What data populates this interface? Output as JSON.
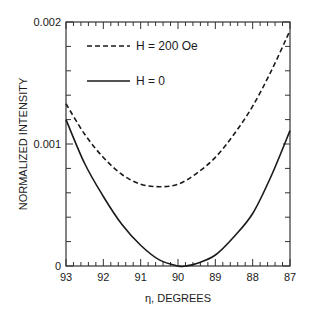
{
  "chart_data": {
    "type": "line",
    "title": "",
    "xlabel": "η, DEGREES",
    "ylabel": "NORMALIZED INTENSITY",
    "xlim": [
      93,
      87
    ],
    "ylim": [
      0,
      0.002
    ],
    "x_ticks": [
      93,
      92,
      91,
      90,
      89,
      88,
      87
    ],
    "x_tick_labels": [
      "93",
      "92",
      "91",
      "90",
      "89",
      "88",
      "87"
    ],
    "y_ticks": [
      0,
      0.001,
      0.002
    ],
    "y_tick_labels": [
      "0",
      "0.001",
      "0.002"
    ],
    "x_minor_step": 0.2,
    "y_minor_step": 0.0002,
    "grid": false,
    "legend_position": "upper-left-inside",
    "series": [
      {
        "name": "H = 200 Oe",
        "style": "dashed",
        "x": [
          93,
          92.5,
          92,
          91.5,
          91,
          90.5,
          90,
          89.5,
          89,
          88.5,
          88,
          87.5,
          87
        ],
        "values": [
          0.00133,
          0.00108,
          0.00089,
          0.00075,
          0.00067,
          0.00065,
          0.00067,
          0.00076,
          0.00089,
          0.00108,
          0.00131,
          0.0016,
          0.00193
        ]
      },
      {
        "name": "H = 0",
        "style": "solid",
        "x": [
          93,
          92.5,
          92,
          91.5,
          91,
          90.5,
          90,
          89.8,
          89.5,
          89,
          88.5,
          88,
          87.5,
          87
        ],
        "values": [
          0.0012,
          0.00084,
          0.00057,
          0.00034,
          0.00017,
          5e-05,
          0.0,
          0.0,
          2e-05,
          9e-05,
          0.00024,
          0.00043,
          0.00074,
          0.00111
        ]
      }
    ]
  },
  "legend": {
    "items": [
      {
        "label": "H = 200 Oe",
        "style": "dashed"
      },
      {
        "label": "H = 0",
        "style": "solid"
      }
    ]
  },
  "axes": {
    "xlabel": "η, DEGREES",
    "ylabel": "NORMALIZED INTENSITY"
  },
  "colors": {
    "line": "#1a1a1a",
    "axis": "#333333",
    "background": "#ffffff"
  }
}
